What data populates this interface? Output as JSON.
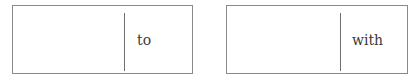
{
  "boxes": [
    {
      "blank_value": "",
      "word": "to"
    },
    {
      "blank_value": "",
      "word": "with"
    }
  ]
}
